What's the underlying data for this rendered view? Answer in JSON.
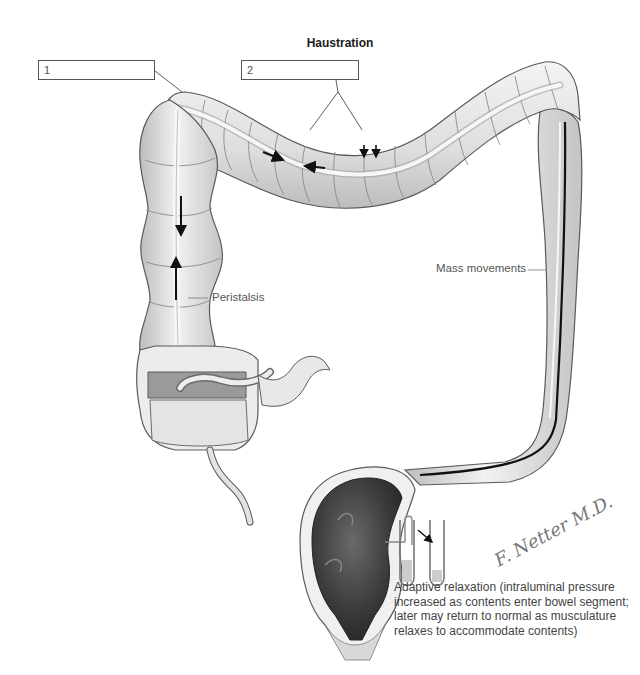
{
  "figure": {
    "title": "Haustration",
    "label_boxes": [
      {
        "id": "1",
        "text": "1"
      },
      {
        "id": "2",
        "text": "2"
      }
    ],
    "annotations": {
      "peristalsis": "Peristalsis",
      "mass_movements": "Mass movements"
    },
    "caption": "Adaptive relaxation (intraluminal pressure increased as contents enter bowel segment; later may return to normal as musculature relaxes to accommodate contents)",
    "signature": "F. Netter M.D.",
    "colors": {
      "colon_fill": "#e6e6e6",
      "colon_shade": "#c8c8c8",
      "outline": "#5a5a5a",
      "rectum_dark": "#3a3a3a",
      "arrow": "#111111",
      "text": "#555555"
    }
  }
}
